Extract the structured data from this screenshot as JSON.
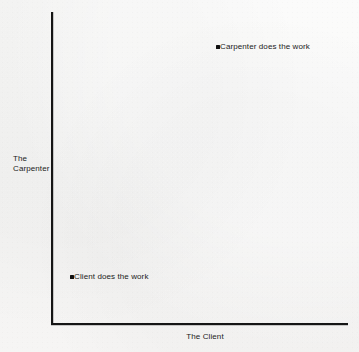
{
  "chart_data": {
    "type": "scatter",
    "title": "",
    "subtitle": "",
    "xlabel": "The Client",
    "ylabel": "The Carpenter",
    "ylabel_lines": [
      "The",
      "Carpenter"
    ],
    "grid": false,
    "legend": "none",
    "xlim": [
      0,
      1
    ],
    "ylim": [
      0,
      1
    ],
    "xticks": [],
    "yticks": [],
    "points": [
      {
        "id": "carpenter-does-the-work",
        "label": "Carpenter does the work",
        "x": 0.56,
        "y": 0.89,
        "marker": "square",
        "color": "#101010"
      },
      {
        "id": "client-does-the-work",
        "label": "Client does the work",
        "x": 0.06,
        "y": 0.15,
        "marker": "square",
        "color": "#101010"
      }
    ],
    "annotations": [],
    "colors": {
      "background": "#f5f5f4",
      "axis": "#151515",
      "text": "#1b1b1b",
      "marker": "#101010"
    }
  }
}
